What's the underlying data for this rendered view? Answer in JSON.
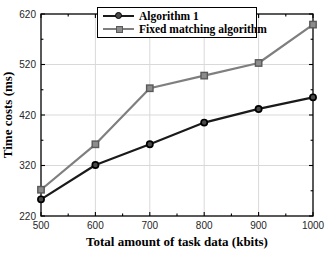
{
  "figure": {
    "background": "#ffffff",
    "axis_color": "#000000",
    "grid_color": "#d9d9d9",
    "tick_label_color": "#262626"
  },
  "chart_data": {
    "type": "line",
    "title": "",
    "xlabel": "Total amount of task data (kbits)",
    "ylabel": "Time costs (ms)",
    "x": [
      500,
      600,
      700,
      800,
      900,
      1000
    ],
    "xlim": [
      500,
      1000
    ],
    "ylim": [
      220,
      620
    ],
    "x_ticks": [
      500,
      600,
      700,
      800,
      900,
      1000
    ],
    "y_ticks": [
      220,
      320,
      420,
      520,
      620
    ],
    "x_minor_ticks": [
      550,
      650,
      750,
      850,
      950
    ],
    "y_minor_ticks": [
      270,
      370,
      470,
      570
    ],
    "grid": true,
    "legend_position": "top-center-inside",
    "series": [
      {
        "name": "Algorithm 1",
        "marker": "circle",
        "line_color": "#1a1a1a",
        "marker_fill": "#4a4a4a",
        "marker_edge": "#000000",
        "values": [
          253,
          321,
          362,
          405,
          432,
          455
        ]
      },
      {
        "name": "Fixed matching algorithm",
        "marker": "square",
        "line_color": "#7f7f7f",
        "marker_fill": "#8c8c8c",
        "marker_edge": "#595959",
        "values": [
          272,
          362,
          473,
          498,
          523,
          599
        ]
      }
    ]
  }
}
